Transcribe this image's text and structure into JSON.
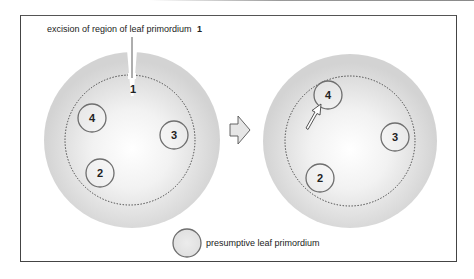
{
  "annotation": {
    "text": "excision of region of leaf primordium",
    "number": "1"
  },
  "left_panel": {
    "excised_label": "1",
    "primordia": [
      {
        "label": "4",
        "cx": 92,
        "cy": 118
      },
      {
        "label": "3",
        "cx": 174,
        "cy": 135
      },
      {
        "label": "2",
        "cx": 100,
        "cy": 173
      }
    ]
  },
  "right_panel": {
    "primordia": [
      {
        "label": "4",
        "cx": 328,
        "cy": 95
      },
      {
        "label": "3",
        "cx": 395,
        "cy": 137
      },
      {
        "label": "2",
        "cx": 320,
        "cy": 178
      }
    ]
  },
  "transition_arrow": "right-arrow",
  "legend": {
    "label": "presumptive leaf primordium"
  },
  "colors": {
    "disc_outer": "#d4d4d4",
    "disc_center": "#ffffff",
    "primordium_stroke": "#6e6e6e",
    "frame": "#444444",
    "text": "#222222"
  }
}
